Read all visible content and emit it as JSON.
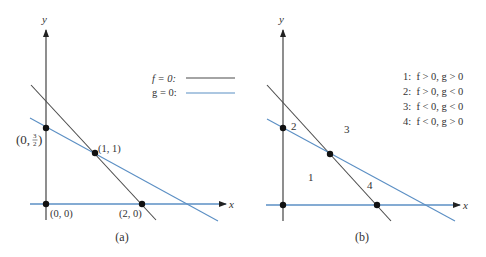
{
  "colors": {
    "axis": "#444444",
    "f_line": "#4a4a4a",
    "g_line": "#5b8fc4",
    "point": "#111111",
    "text": "#333333"
  },
  "panel_a": {
    "caption": "(a)",
    "axis_x_label": "x",
    "axis_y_label": "y",
    "legend": [
      {
        "label": "f = 0:",
        "line": "f_line"
      },
      {
        "label": "g = 0:",
        "line": "g_line"
      }
    ],
    "points": [
      {
        "label": "(0, 0)"
      },
      {
        "label": "(2, 0)"
      },
      {
        "label": "(1, 1)"
      },
      {
        "label_prefix": "(0, ",
        "frac_num": "3",
        "frac_den": "2",
        "label_suffix": ")"
      }
    ]
  },
  "panel_b": {
    "caption": "(b)",
    "axis_x_label": "x",
    "axis_y_label": "y",
    "region_labels": [
      "1",
      "2",
      "3",
      "4"
    ],
    "legend": [
      "1:  f > 0, g > 0",
      "2:  f > 0, g < 0",
      "3:  f < 0, g < 0",
      "4:  f < 0, g > 0"
    ]
  }
}
